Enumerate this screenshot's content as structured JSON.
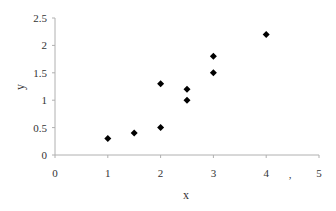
{
  "chart_data": {
    "type": "scatter",
    "title": "",
    "xlabel": "x",
    "ylabel": "y",
    "xlim": [
      0,
      5
    ],
    "ylim": [
      0,
      2.5
    ],
    "x_ticks": [
      "0",
      "1",
      "2",
      "3",
      "4",
      "5"
    ],
    "y_ticks": [
      "0",
      "0.5",
      "1",
      "1.5",
      "2",
      "2.5"
    ],
    "grid": false,
    "legend": null,
    "marker": "diamond",
    "marker_color": "#000000",
    "series": [
      {
        "name": "data",
        "points": [
          {
            "x": 1,
            "y": 0.3
          },
          {
            "x": 1.5,
            "y": 0.4
          },
          {
            "x": 2,
            "y": 0.5
          },
          {
            "x": 2,
            "y": 1.3
          },
          {
            "x": 2.5,
            "y": 1.0
          },
          {
            "x": 2.5,
            "y": 1.2
          },
          {
            "x": 3,
            "y": 1.5
          },
          {
            "x": 3,
            "y": 1.8
          },
          {
            "x": 4,
            "y": 2.2
          }
        ]
      }
    ],
    "annotations": [
      ","
    ]
  }
}
